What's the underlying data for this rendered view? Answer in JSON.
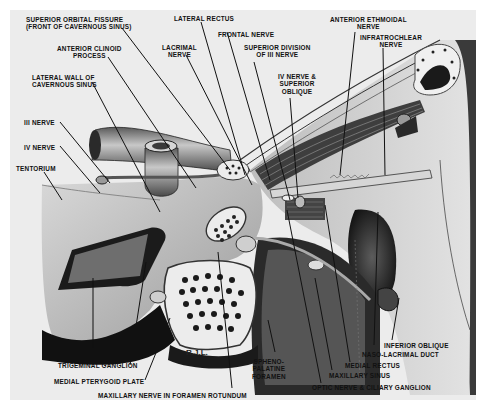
{
  "figure": {
    "type": "anatomical illustration",
    "signature": "R.J.L.",
    "palette": {
      "background": "#ffffff",
      "plate": "#ececec",
      "ink": "#111111",
      "mid_gray": "#8a8a8a",
      "dark": "#1e1e1e"
    }
  },
  "labels": {
    "superior_orbital_fissure": "SUPERIOR ORBITAL FISSURE\n(FRONT OF CAVERNOUS SINUS)",
    "lateral_rectus": "LATERAL RECTUS",
    "frontal_nerve": "FRONTAL NERVE",
    "anterior_ethmoidal_nerve": "ANTERIOR ETHMOIDAL\nNERVE",
    "infratrochlear_nerve": "INFRATROCHLEAR\nNERVE",
    "anterior_clinoid_process": "ANTERIOR CLINOID\nPROCESS",
    "lacrimal_nerve": "LACRIMAL\nNERVE",
    "superior_division_iii": "SUPERIOR DIVISION\nOF III NERVE",
    "iv_nerve_superior_oblique": "IV NERVE &\nSUPERIOR\nOBLIQUE",
    "lateral_wall_cavernous_sinus": "LATERAL WALL OF\nCAVERNOUS SINUS",
    "iii_nerve": "III NERVE",
    "iv_nerve": "IV NERVE",
    "tentorium": "TENTORIUM",
    "meckels_cave": "MECKEL'S CAVE",
    "trigeminal_ganglion": "TRIGEMINAL GANGLION",
    "medial_pterygoid_plate": "MEDIAL PTERYGOID PLATE",
    "maxillary_nerve_foramen_rotundum": "MAXILLARY NERVE IN FORAMEN ROTUNDUM",
    "sphenopalatine_foramen": "SPHENO-\nPALATINE\nFORAMEN",
    "optic_nerve_ciliary_ganglion": "OPTIC NERVE & CILIARY GANGLION",
    "maxillary_sinus": "MAXILLARY SINUS",
    "medial_rectus": "MEDIAL RECTUS",
    "naso_lacrimal_duct": "NASO-LACRIMAL DUCT",
    "inferior_oblique": "INFERIOR OBLIQUE"
  }
}
